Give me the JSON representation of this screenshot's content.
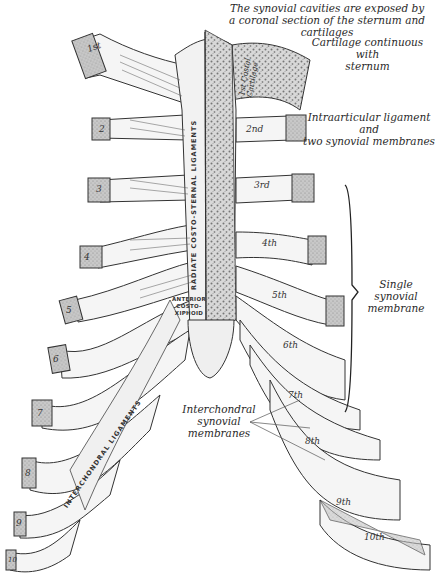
{
  "figure": {
    "title_caption": {
      "line1": "The synovial cavities are exposed by",
      "line2": "a coronal section of the sternum and cartilages"
    },
    "annotations": {
      "cartilage_continuous": {
        "line1": "Cartilage continuous with",
        "line2": "sternum"
      },
      "intraarticular": {
        "line1": "Intraarticular ligament and",
        "line2": "two synovial membranes"
      },
      "single_synovial": {
        "line1": "Single synovial",
        "line2": "membrane"
      },
      "interchondral": {
        "line1": "Interchondral",
        "line2": "synovial",
        "line3": "membranes"
      }
    },
    "structure_labels": {
      "radiate_ligaments": "RADIATE COSTO-STERNAL LIGAMENTS",
      "anterior_costoxiphoid_1": "ANTERIOR",
      "anterior_costoxiphoid_2": "COSTO-",
      "anterior_costoxiphoid_3": "XIPHOID",
      "interchondral_ligaments": "INTERCHONDRAL LIGAMENTS",
      "first_costal_cartilage_1": "1st Costal",
      "first_costal_cartilage_2": "Cartilage"
    },
    "left_rib_labels": [
      "1st",
      "2",
      "3",
      "4",
      "5",
      "6",
      "7",
      "8",
      "9",
      "10"
    ],
    "right_rib_labels": [
      "2nd",
      "3rd",
      "4th",
      "5th",
      "6th",
      "7th",
      "8th",
      "9th",
      "10th"
    ],
    "colors": {
      "ink": "#2a2a2a",
      "cartilage_fill": "#f4f4f4",
      "bone_fill": "#c9c9c9",
      "marrow": "#9a9a9a",
      "background": "#ffffff"
    }
  }
}
